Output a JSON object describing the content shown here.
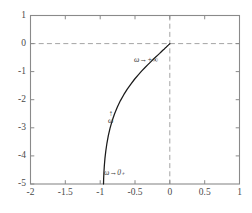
{
  "chart_data": {
    "type": "line",
    "title": "",
    "subtitle": "",
    "xlabel": "",
    "ylabel": "",
    "xlim": [
      -2,
      1
    ],
    "ylim": [
      -5,
      1
    ],
    "grid": false,
    "legend": null,
    "x_ticks": [
      "-2",
      "-1.5",
      "-1",
      "-0.5",
      "0",
      "0.5",
      "1"
    ],
    "x_tick_values": [
      -2,
      -1.5,
      -1,
      -0.5,
      0,
      0.5,
      1
    ],
    "y_ticks": [
      "1",
      "0",
      "-1",
      "-2",
      "-3",
      "-4",
      "-5"
    ],
    "y_tick_values": [
      1,
      0,
      -1,
      -2,
      -3,
      -4,
      -5
    ],
    "reference_lines": [
      {
        "name": "zero-real-axis",
        "orientation": "horizontal",
        "value": 0,
        "style": "dashed",
        "color": "#9a9a9a"
      },
      {
        "name": "zero-imaginary-axis",
        "orientation": "vertical",
        "value": 0,
        "style": "dashed",
        "color": "#9a9a9a"
      }
    ],
    "series": [
      {
        "name": "locus",
        "color": "#1a1a1a",
        "style": "solid",
        "x": [
          -0.952,
          -0.95,
          -0.946,
          -0.94,
          -0.931,
          -0.919,
          -0.903,
          -0.883,
          -0.858,
          -0.828,
          -0.793,
          -0.753,
          -0.709,
          -0.661,
          -0.611,
          -0.559,
          -0.507,
          -0.456,
          -0.406,
          -0.359,
          -0.315,
          -0.274,
          -0.237,
          -0.203,
          -0.173,
          -0.146,
          -0.122,
          -0.101,
          -0.083,
          -0.067,
          -0.053,
          -0.041,
          -0.031,
          -0.022,
          -0.015,
          -0.009,
          -0.004,
          0.0
        ],
        "y": [
          -5.0,
          -4.8,
          -4.58,
          -4.34,
          -4.08,
          -3.82,
          -3.55,
          -3.28,
          -3.01,
          -2.75,
          -2.5,
          -2.26,
          -2.03,
          -1.82,
          -1.62,
          -1.44,
          -1.27,
          -1.12,
          -0.98,
          -0.86,
          -0.75,
          -0.65,
          -0.56,
          -0.48,
          -0.41,
          -0.35,
          -0.29,
          -0.24,
          -0.2,
          -0.16,
          -0.13,
          -0.1,
          -0.075,
          -0.055,
          -0.038,
          -0.024,
          -0.012,
          0.0
        ]
      }
    ],
    "annotations": [
      {
        "name": "omega-to-zero-plus",
        "text": "ω→0₊",
        "x": -0.86,
        "y": -4.82
      },
      {
        "name": "omega-direction",
        "arrow": "↑",
        "text": "ω",
        "x": -0.78,
        "y": -2.72
      },
      {
        "name": "omega-to-infinity",
        "text": "ω→+∞",
        "x": -0.42,
        "y": -0.55
      }
    ],
    "axes_style": {
      "frame_color": "#8a8a8a",
      "curve_color": "#1a1a1a",
      "dashed_color": "#9a9a9a",
      "background": "#ffffff",
      "tick_label_color": "#4a4a4a"
    }
  }
}
